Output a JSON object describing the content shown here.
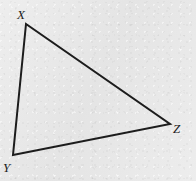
{
  "figure": {
    "name": "triangle-xyz",
    "canvas": {
      "width": 196,
      "height": 181
    },
    "background_color": "#e9e9e9",
    "stroke_color": "#1c1c1c",
    "stroke_width": 2,
    "fill": "none",
    "vertices": [
      {
        "id": "X",
        "label": "X",
        "x": 26,
        "y": 24,
        "label_x": 17,
        "label_y": 8
      },
      {
        "id": "Y",
        "label": "Y",
        "x": 13,
        "y": 155,
        "label_x": 3,
        "label_y": 161
      },
      {
        "id": "Z",
        "label": "Z",
        "x": 170,
        "y": 124,
        "label_x": 173,
        "label_y": 122
      }
    ],
    "edges": [
      {
        "id": "XZ",
        "from": "X",
        "to": "Z"
      },
      {
        "id": "ZY",
        "from": "Z",
        "to": "Y"
      },
      {
        "id": "YX",
        "from": "Y",
        "to": "X"
      }
    ],
    "polygon_points": "26,24 170,124 13,155"
  }
}
